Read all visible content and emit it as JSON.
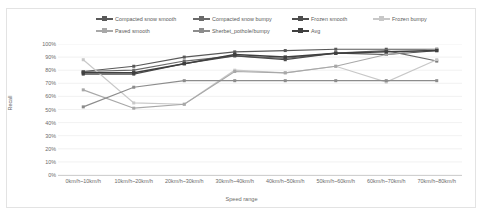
{
  "chart_data": {
    "type": "line",
    "title": "",
    "xlabel": "Speed range",
    "ylabel": "Recall",
    "ylim": [
      0,
      100
    ],
    "y_ticks": [
      "0%",
      "10%",
      "20%",
      "30%",
      "40%",
      "50%",
      "60%",
      "70%",
      "80%",
      "90%",
      "100%"
    ],
    "grid": true,
    "legend_position": "top",
    "categories": [
      "0km/h~10km/h",
      "10km/h~20km/h",
      "20km/h~30km/h",
      "30km/h~40km/h",
      "40km/h~50km/h",
      "50km/h~60km/h",
      "60km/h~70km/h",
      "70km/h~80km/h"
    ],
    "series": [
      {
        "name": "Compacted snow smooth",
        "color": "#595959",
        "marker": "square",
        "values": [
          79,
          83,
          90,
          94,
          95,
          96,
          96,
          96
        ]
      },
      {
        "name": "Compacted snow bumpy",
        "color": "#6a6a6a",
        "marker": "square",
        "values": [
          79,
          80,
          87,
          91,
          89,
          93,
          95,
          87
        ]
      },
      {
        "name": "Frozen smooth",
        "color": "#4d4d4d",
        "marker": "square",
        "values": [
          77,
          77,
          85,
          91,
          88,
          93,
          92,
          95
        ]
      },
      {
        "name": "Frozen bumpy",
        "color": "#c8c8c8",
        "marker": "square",
        "values": [
          88,
          55,
          54,
          80,
          78,
          83,
          71,
          88
        ]
      },
      {
        "name": "Paved smooth",
        "color": "#a8a8a8",
        "marker": "square",
        "values": [
          65,
          51,
          54,
          79,
          78,
          83,
          92,
          96
        ]
      },
      {
        "name": "Sherbet_pothole/bumpy",
        "color": "#8c8c8c",
        "marker": "square",
        "values": [
          52,
          67,
          72,
          72,
          72,
          72,
          72,
          72
        ]
      },
      {
        "name": "Avg",
        "color": "#3f3f3f",
        "marker": "square",
        "values": [
          78,
          78,
          85,
          92,
          90,
          93,
          94,
          95
        ]
      }
    ]
  },
  "legend": {
    "row1": [
      "Compacted snow smooth",
      "Compacted snow bumpy",
      "Frozen smooth",
      "Frozen bumpy"
    ],
    "row2": [
      "Paved smooth",
      "Sherbet_pothole/bumpy",
      "Avg"
    ]
  }
}
